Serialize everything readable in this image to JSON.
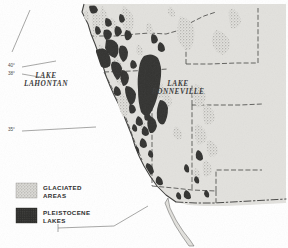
{
  "figure": {
    "kind": "thematic-map",
    "region": "Western United States",
    "background_color": "#ffffff",
    "land_fill": "#e2e1dd",
    "stipple_color": "#b9b8b4",
    "lake_fill": "#333331",
    "coast_stroke": "#3d3d3b",
    "border_stroke": "#4a4a48"
  },
  "legend": {
    "items": [
      {
        "swatch": "glaciated-swatch",
        "label": "GLACIATED\nAREAS",
        "pattern": "stipple-light",
        "color": "#b9b8b4"
      },
      {
        "swatch": "pleistocene-swatch",
        "label": "PLEISTOCENE\nLAKES",
        "pattern": "stipple-dark",
        "color": "#333331"
      }
    ]
  },
  "map_labels": {
    "lahontan": "LAKE\nLAHONTAN",
    "bonneville": "LAKE\nBONNEVILLE"
  },
  "graticule": {
    "ticks": [
      {
        "name": "lat-40",
        "label": "40°"
      },
      {
        "name": "lat-38",
        "label": "38°"
      },
      {
        "name": "lat-35",
        "label": "35°"
      }
    ]
  }
}
